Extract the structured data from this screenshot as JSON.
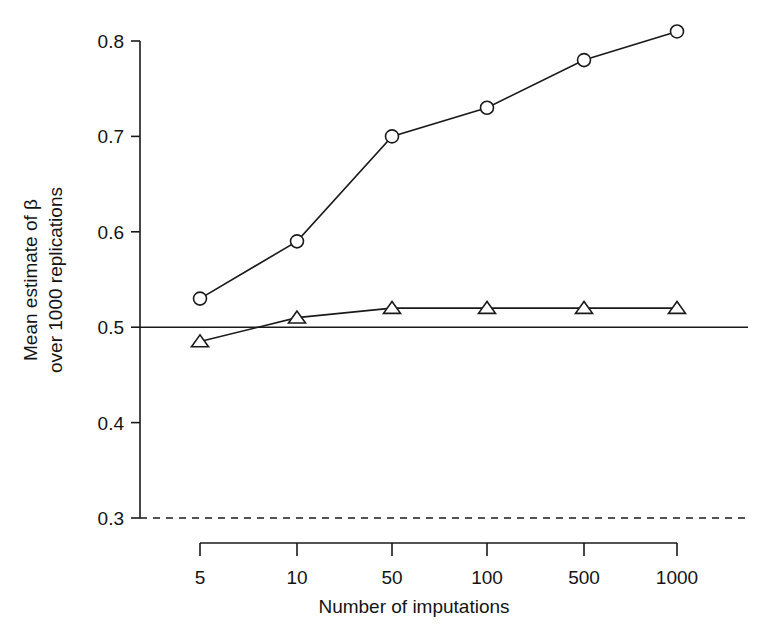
{
  "chart_data": {
    "type": "line",
    "title": "",
    "subtitle": "",
    "xlabel": "Number of imputations",
    "ylabel": "Mean estimate of β over 1000 replications",
    "ylabel_line1": "Mean estimate of β",
    "ylabel_line2": "over 1000 replications",
    "categories": [
      "5",
      "10",
      "50",
      "100",
      "500",
      "1000"
    ],
    "x_tick_labels": [
      "5",
      "10",
      "50",
      "100",
      "500",
      "1000"
    ],
    "y_tick_labels": [
      "0.3",
      "0.4",
      "0.5",
      "0.6",
      "0.7",
      "0.8"
    ],
    "y_tick_values": [
      0.3,
      0.4,
      0.5,
      0.6,
      0.7,
      0.8
    ],
    "ylim": [
      0.3,
      0.8
    ],
    "xlim_categorical": true,
    "grid": false,
    "legend": "none",
    "series": [
      {
        "name": "circle-series",
        "marker": "open-circle",
        "linestyle": "solid",
        "color": "#1a1a1a",
        "values": [
          0.53,
          0.59,
          0.7,
          0.73,
          0.78,
          0.81
        ]
      },
      {
        "name": "triangle-series",
        "marker": "open-triangle",
        "linestyle": "solid",
        "color": "#1a1a1a",
        "values": [
          0.485,
          0.51,
          0.52,
          0.52,
          0.52,
          0.52
        ]
      }
    ],
    "reference_lines": [
      {
        "name": "true-value-line",
        "y": 0.5,
        "linestyle": "solid",
        "color": "#1a1a1a"
      },
      {
        "name": "lower-reference-line",
        "y": 0.3,
        "linestyle": "dashed",
        "color": "#1a1a1a"
      }
    ],
    "axis_color": "#1a1a1a"
  }
}
